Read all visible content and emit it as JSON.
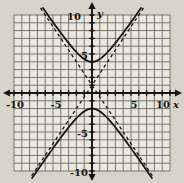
{
  "chart_data": {
    "type": "line",
    "title": "",
    "axes": {
      "x_label": "x",
      "y_label": "y",
      "xlim": [
        -10,
        10
      ],
      "ylim": [
        -10,
        10
      ],
      "grid_step": 1,
      "grid": true,
      "x_tick_labels": [
        -10,
        -5,
        5,
        10
      ],
      "y_tick_labels": [
        10,
        5,
        -5,
        -10
      ]
    },
    "hyperbola": {
      "equation": "(y-1)^2/9 - x^2/4 = 1",
      "orientation": "vertical",
      "center": [
        0,
        1
      ],
      "a": 3,
      "b": 2,
      "vertices": [
        [
          0,
          4
        ],
        [
          0,
          -2
        ]
      ]
    },
    "series": [
      {
        "name": "hyperbola-upper-branch",
        "style": "solid",
        "equation": "y = 1 + 3*sqrt(1 + x^2/4)"
      },
      {
        "name": "hyperbola-lower-branch",
        "style": "solid",
        "equation": "y = 1 - 3*sqrt(1 + x^2/4)"
      },
      {
        "name": "asymptote-rising",
        "style": "dashed",
        "equation": "y = 1 + 1.5x",
        "slope": 1.5,
        "intercept": 1
      },
      {
        "name": "asymptote-falling",
        "style": "dashed",
        "equation": "y = 1 - 1.5x",
        "slope": -1.5,
        "intercept": 1
      }
    ],
    "legend": null
  },
  "style": {
    "paper": "#d7d4ca",
    "plot_bg": "#e9e7df",
    "ink": "#161616",
    "grid_line": "#46453f"
  }
}
